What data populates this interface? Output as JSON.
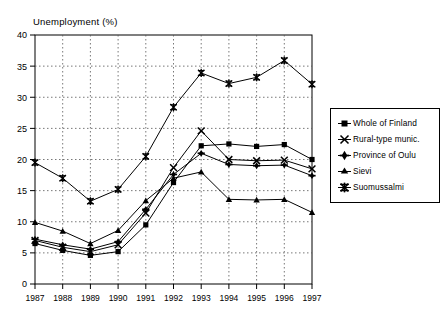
{
  "chart_data": {
    "type": "line",
    "title": "",
    "ylabel": "Unemployment (%)",
    "xlabel": "",
    "ylim": [
      0,
      40
    ],
    "yticks": [
      0,
      5,
      10,
      15,
      20,
      25,
      30,
      35,
      40
    ],
    "grid": true,
    "legend_position": "right",
    "categories": [
      "1987",
      "1988",
      "1989",
      "1990",
      "1991",
      "1992",
      "1993",
      "1994",
      "1995",
      "1996",
      "1997"
    ],
    "series": [
      {
        "name": "Whole of Finland",
        "marker": "filled-square",
        "values": [
          6.5,
          5.4,
          4.6,
          5.2,
          9.5,
          16.3,
          22.2,
          22.5,
          22.1,
          22.4,
          20.0
        ]
      },
      {
        "name": "Rural-type munic.",
        "marker": "x-cross",
        "values": [
          7.0,
          5.9,
          5.2,
          6.3,
          11.4,
          18.7,
          24.6,
          20.0,
          19.8,
          19.9,
          18.5
        ]
      },
      {
        "name": "Province of Oulu",
        "marker": "plus-diamond",
        "values": [
          7.2,
          6.3,
          5.6,
          6.8,
          12.0,
          17.6,
          21.0,
          19.2,
          19.0,
          19.1,
          17.4
        ]
      },
      {
        "name": "Sievi",
        "marker": "filled-triangle",
        "values": [
          9.9,
          8.5,
          6.5,
          8.6,
          13.4,
          17.0,
          18.0,
          13.6,
          13.5,
          13.6,
          11.5
        ]
      },
      {
        "name": "Suomussalmi",
        "marker": "star-bar",
        "values": [
          19.5,
          17.0,
          13.3,
          15.2,
          20.5,
          28.4,
          33.9,
          32.2,
          33.2,
          35.9,
          32.1
        ]
      }
    ]
  }
}
